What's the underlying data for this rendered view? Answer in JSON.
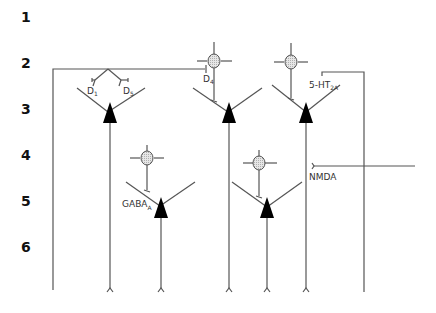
{
  "layers": [
    {
      "label": "1",
      "y": 18
    },
    {
      "label": "2",
      "y": 64
    },
    {
      "label": "3",
      "y": 110
    },
    {
      "label": "4",
      "y": 156
    },
    {
      "label": "5",
      "y": 202
    },
    {
      "label": "6",
      "y": 248
    }
  ],
  "receptors": {
    "d1": {
      "main": "D",
      "sub": "1"
    },
    "d5": {
      "main": "D",
      "sub": "5"
    },
    "d4": {
      "main": "D",
      "sub": "4"
    },
    "ht2a": {
      "main": "5-HT",
      "sub": "2A"
    },
    "gaba": {
      "main": "GABA",
      "sub": "A"
    },
    "nmda": {
      "main": "NMDA"
    }
  },
  "colors": {
    "line": "#555555",
    "soma": "#000000",
    "interneuron_fill": "#d8d8d8"
  }
}
